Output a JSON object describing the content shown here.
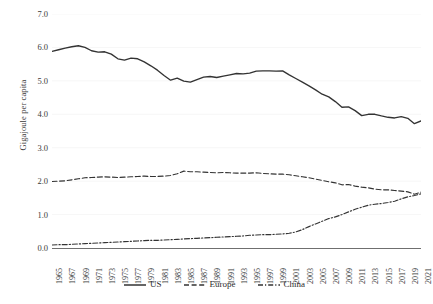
{
  "chart_data": {
    "type": "line",
    "title": "",
    "xlabel": "",
    "ylabel": "Gigajoule per capita",
    "ylim": [
      0.0,
      7.0
    ],
    "xlim": [
      1965,
      2021
    ],
    "grid": false,
    "legend_position": "bottom",
    "ytick_labels": [
      "7.0",
      "6.0",
      "5.0",
      "4.0",
      "3.0",
      "2.0",
      "1.0",
      "0.0"
    ],
    "ytick_values": [
      7.0,
      6.0,
      5.0,
      4.0,
      3.0,
      2.0,
      1.0,
      0.0
    ],
    "xtick_labels": [
      "1965",
      "1967",
      "1969",
      "1971",
      "1973",
      "1975",
      "1977",
      "1979",
      "1981",
      "1983",
      "1985",
      "1987",
      "1989",
      "1991",
      "1993",
      "1995",
      "1997",
      "1999",
      "2001",
      "2003",
      "2005",
      "2007",
      "2009",
      "2011",
      "2013",
      "2015",
      "2017",
      "2019",
      "2021"
    ],
    "x": [
      1965,
      1966,
      1967,
      1968,
      1969,
      1970,
      1971,
      1972,
      1973,
      1974,
      1975,
      1976,
      1977,
      1978,
      1979,
      1980,
      1981,
      1982,
      1983,
      1984,
      1985,
      1986,
      1987,
      1988,
      1989,
      1990,
      1991,
      1992,
      1993,
      1994,
      1995,
      1996,
      1997,
      1998,
      1999,
      2000,
      2001,
      2002,
      2003,
      2004,
      2005,
      2006,
      2007,
      2008,
      2009,
      2010,
      2011,
      2012,
      2013,
      2014,
      2015,
      2016,
      2017,
      2018,
      2019,
      2020,
      2021
    ],
    "series": [
      {
        "name": "US",
        "style": "solid",
        "color": "#333333",
        "values": [
          5.88,
          5.93,
          5.98,
          6.02,
          6.05,
          6.0,
          5.9,
          5.86,
          5.87,
          5.8,
          5.66,
          5.62,
          5.68,
          5.66,
          5.57,
          5.45,
          5.32,
          5.16,
          5.02,
          5.08,
          4.99,
          4.96,
          5.04,
          5.11,
          5.13,
          5.1,
          5.14,
          5.18,
          5.22,
          5.21,
          5.23,
          5.29,
          5.3,
          5.3,
          5.29,
          5.3,
          5.18,
          5.07,
          4.96,
          4.85,
          4.73,
          4.6,
          4.52,
          4.38,
          4.21,
          4.22,
          4.11,
          3.96,
          4.0,
          4.0,
          3.95,
          3.91,
          3.89,
          3.93,
          3.88,
          3.72,
          3.8
        ]
      },
      {
        "name": "Europe",
        "style": "dashed",
        "color": "#333333",
        "values": [
          1.99,
          2.0,
          2.01,
          2.04,
          2.07,
          2.1,
          2.11,
          2.12,
          2.13,
          2.12,
          2.11,
          2.12,
          2.13,
          2.14,
          2.15,
          2.14,
          2.14,
          2.15,
          2.17,
          2.22,
          2.3,
          2.28,
          2.28,
          2.27,
          2.26,
          2.25,
          2.26,
          2.25,
          2.24,
          2.24,
          2.24,
          2.25,
          2.23,
          2.22,
          2.21,
          2.21,
          2.19,
          2.16,
          2.13,
          2.1,
          2.06,
          2.02,
          1.98,
          1.95,
          1.89,
          1.9,
          1.85,
          1.82,
          1.8,
          1.76,
          1.74,
          1.74,
          1.72,
          1.7,
          1.68,
          1.61,
          1.67
        ]
      },
      {
        "name": "China",
        "style": "dashdot",
        "color": "#333333",
        "values": [
          0.09,
          0.1,
          0.1,
          0.11,
          0.12,
          0.13,
          0.14,
          0.15,
          0.16,
          0.17,
          0.18,
          0.19,
          0.2,
          0.21,
          0.22,
          0.23,
          0.23,
          0.24,
          0.25,
          0.26,
          0.27,
          0.28,
          0.29,
          0.3,
          0.31,
          0.32,
          0.33,
          0.34,
          0.35,
          0.36,
          0.38,
          0.39,
          0.4,
          0.4,
          0.41,
          0.42,
          0.44,
          0.48,
          0.55,
          0.64,
          0.72,
          0.8,
          0.88,
          0.93,
          1.0,
          1.08,
          1.16,
          1.22,
          1.28,
          1.31,
          1.33,
          1.36,
          1.4,
          1.47,
          1.53,
          1.57,
          1.62
        ]
      }
    ]
  },
  "legend": {
    "items": [
      {
        "label": "US",
        "style": "solid"
      },
      {
        "label": "Europe",
        "style": "dashed"
      },
      {
        "label": "China",
        "style": "dashdot"
      }
    ]
  }
}
